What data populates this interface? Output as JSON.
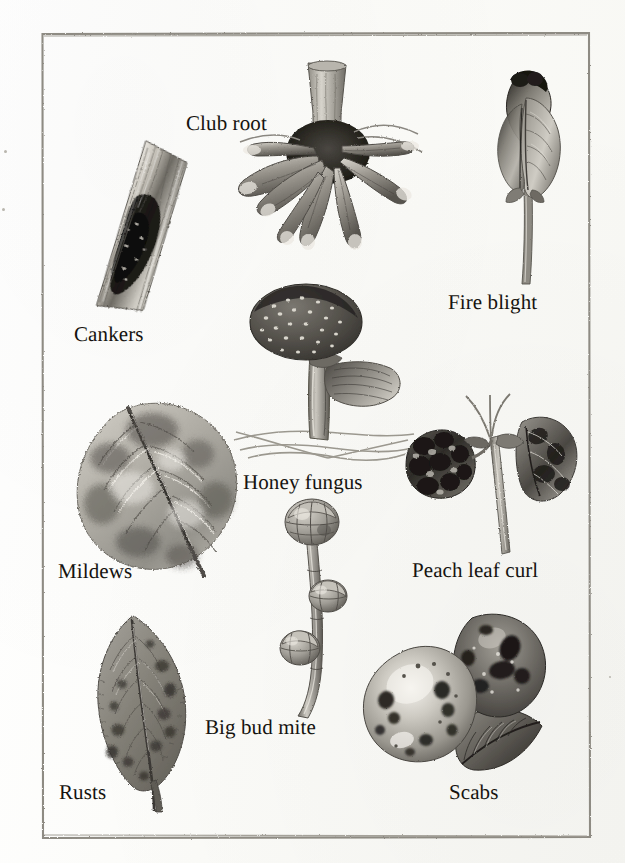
{
  "plate": {
    "title": "Common plant diseases and pests",
    "background_color": "#fdfdfb",
    "ink_color": "#15130f",
    "frame_color": "#8e8b83",
    "frame": {
      "x": 41,
      "y": 32,
      "width": 550,
      "height": 807
    }
  },
  "labels": [
    {
      "id": "club-root",
      "text": "Club root",
      "x": 186,
      "y": 113,
      "font_size": 21
    },
    {
      "id": "cankers",
      "text": "Cankers",
      "x": 74,
      "y": 324,
      "font_size": 21
    },
    {
      "id": "fire-blight",
      "text": "Fire blight",
      "x": 448,
      "y": 292,
      "font_size": 21
    },
    {
      "id": "honey-fungus",
      "text": "Honey fungus",
      "x": 243,
      "y": 472,
      "font_size": 21
    },
    {
      "id": "mildews",
      "text": "Mildews",
      "x": 58,
      "y": 561,
      "font_size": 21
    },
    {
      "id": "peach-leaf-curl",
      "text": "Peach leaf curl",
      "x": 412,
      "y": 560,
      "font_size": 21
    },
    {
      "id": "big-bud-mite",
      "text": "Big bud mite",
      "x": 205,
      "y": 717,
      "font_size": 21
    },
    {
      "id": "rusts",
      "text": "Rusts",
      "x": 59,
      "y": 782,
      "font_size": 21
    },
    {
      "id": "scabs",
      "text": "Scabs",
      "x": 449,
      "y": 782,
      "font_size": 21
    }
  ],
  "figures": [
    {
      "id": "cankers-bark",
      "name": "diseased-bark-canker-illustration",
      "x": 82,
      "y": 130,
      "width": 110,
      "height": 190
    },
    {
      "id": "club-root-root",
      "name": "club-root-swollen-root-illustration",
      "x": 222,
      "y": 60,
      "width": 210,
      "height": 225
    },
    {
      "id": "fire-blight-shoot",
      "name": "fire-blight-blackened-shoot-illustration",
      "x": 480,
      "y": 62,
      "width": 100,
      "height": 225
    },
    {
      "id": "honey-fungus-cap",
      "name": "honey-fungus-mushroom-illustration",
      "x": 232,
      "y": 282,
      "width": 180,
      "height": 190
    },
    {
      "id": "mildews-leaf",
      "name": "mildew-infected-leaf-illustration",
      "x": 66,
      "y": 396,
      "width": 185,
      "height": 185
    },
    {
      "id": "peach-leaf-shoot",
      "name": "peach-leaf-curl-shoot-illustration",
      "x": 398,
      "y": 392,
      "width": 180,
      "height": 175
    },
    {
      "id": "big-bud-twig",
      "name": "big-bud-mite-swollen-buds-illustration",
      "x": 266,
      "y": 500,
      "width": 90,
      "height": 215
    },
    {
      "id": "rusts-leaf",
      "name": "rust-spotted-leaf-illustration",
      "x": 74,
      "y": 610,
      "width": 130,
      "height": 200
    },
    {
      "id": "scabs-apples",
      "name": "scab-infected-apples-illustration",
      "x": 352,
      "y": 604,
      "width": 200,
      "height": 185
    }
  ],
  "margin_specks": [
    {
      "x": 4,
      "y": 150,
      "size": 3
    },
    {
      "x": 2,
      "y": 208,
      "size": 3
    },
    {
      "x": 609,
      "y": 676,
      "size": 2
    }
  ]
}
